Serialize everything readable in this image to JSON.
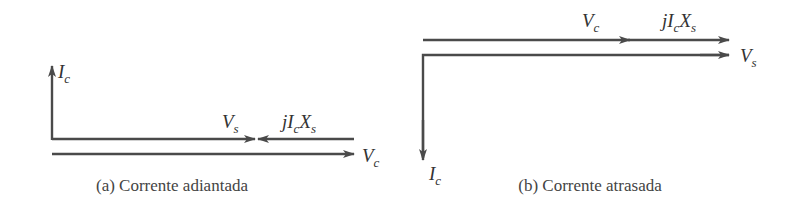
{
  "diagram_a": {
    "caption": "(a) Corrente adiantada",
    "labels": {
      "ic": {
        "main": "I",
        "sub": "c"
      },
      "vs": {
        "main": "V",
        "sub": "s"
      },
      "jicxs": {
        "pre": "jI",
        "sub1": "c",
        "mid": "X",
        "sub2": "s"
      },
      "vc": {
        "main": "V",
        "sub": "c"
      }
    }
  },
  "diagram_b": {
    "caption": "(b) Corrente atrasada",
    "labels": {
      "vc": {
        "main": "V",
        "sub": "c"
      },
      "jicxs": {
        "pre": "jI",
        "sub1": "c",
        "mid": "X",
        "sub2": "s"
      },
      "vs": {
        "main": "V",
        "sub": "s"
      },
      "ic": {
        "main": "I",
        "sub": "c"
      }
    }
  },
  "colors": {
    "stroke": "#4a4a4a",
    "text": "#333333"
  }
}
